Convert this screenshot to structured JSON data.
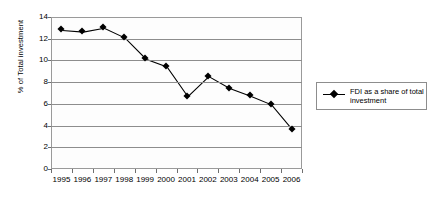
{
  "chart_data": {
    "type": "line",
    "title": "",
    "xlabel": "",
    "ylabel": "% of Total investment",
    "categories": [
      "1995",
      "1996",
      "1997",
      "1998",
      "1999",
      "2000",
      "2001",
      "2002",
      "2003",
      "2004",
      "2005",
      "2006"
    ],
    "values": [
      12.85,
      12.7,
      13.05,
      12.15,
      10.2,
      9.5,
      6.75,
      8.6,
      7.5,
      6.8,
      6.0,
      3.7
    ],
    "series": [
      {
        "name": "FDI as a share of total investment",
        "values": [
          12.85,
          12.7,
          13.05,
          12.15,
          10.2,
          9.5,
          6.75,
          8.6,
          7.5,
          6.8,
          6.0,
          3.7
        ]
      }
    ],
    "ylim": [
      0,
      14
    ],
    "yticks": [
      0,
      2,
      4,
      6,
      8,
      10,
      12,
      14
    ],
    "grid": true,
    "legend_position": "right",
    "marker": "diamond",
    "line_color": "#000000",
    "grid_color": "#8d8d8d"
  },
  "legend": {
    "entries": [
      {
        "label": "FDI as a share of total investment"
      }
    ]
  }
}
